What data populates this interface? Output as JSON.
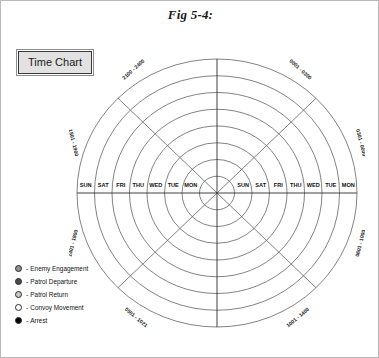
{
  "figure": {
    "title": "Fig 5-4:"
  },
  "button": {
    "label": "Time Chart"
  },
  "chart_data": {
    "type": "polar",
    "title": "Time Chart",
    "grid": true,
    "legend_position": "bottom-left",
    "ring_count": 8,
    "sector_count": 8,
    "sector_labels": [
      "0001 - 0300",
      "0301 - 0600",
      "0601 - 1000",
      "1001 - 1400",
      "1401 - 1700",
      "1701 - 2000",
      "2001 - 2100",
      "2100 - 2400"
    ],
    "sector_labels_positioned": {
      "upper_left": "2100 - 2400",
      "upper_right": "0001 - 0300",
      "right_upper": "0301 - 0600",
      "right_lower": "0601 - 1000",
      "lower_right": "1001 - 1400",
      "lower_left": "0501 - 1021",
      "left_lower": "1401 - 1800",
      "left_upper": "1801 - 1900"
    },
    "day_labels_left": [
      "SUN",
      "SAT",
      "FRI",
      "THU",
      "WED",
      "TUE",
      "MON"
    ],
    "day_labels_right": [
      "MON",
      "TUE",
      "WED",
      "THU",
      "FRI",
      "SAT",
      "SUN"
    ],
    "series": [],
    "values": []
  },
  "legend": {
    "items": [
      {
        "label": "Enemy Engagement",
        "marker": "circle-gray-filled",
        "color": "#8f8f8f"
      },
      {
        "label": "Patrol Departure",
        "marker": "circle-dark-filled",
        "color": "#4a4a4a"
      },
      {
        "label": "Patrol Return",
        "marker": "circle-light-filled",
        "color": "#c8c8c8"
      },
      {
        "label": "Convoy Movement",
        "marker": "circle-hollow",
        "color": "#ffffff"
      },
      {
        "label": "Arrest",
        "marker": "circle-black-filled",
        "color": "#000000"
      }
    ]
  }
}
